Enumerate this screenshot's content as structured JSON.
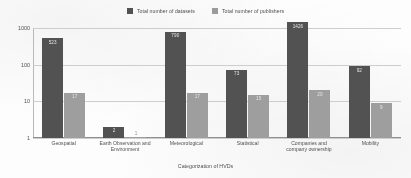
{
  "chart_data": {
    "type": "bar",
    "title": "",
    "xlabel": "Categorization of HVDs",
    "ylabel": "",
    "yscale": "log",
    "ylim": [
      1,
      1000
    ],
    "yticks": [
      "1",
      "10",
      "100",
      "1000"
    ],
    "grid": true,
    "legend_position": "top-center",
    "categories": [
      "Geospatial",
      "Earth Observation and Environment",
      "Meteorological",
      "Statistical",
      "Companies and company ownership",
      "Mobility"
    ],
    "series": [
      {
        "name": "Total number of datasets",
        "color": "#4d4d4d",
        "values": [
          523,
          2,
          790,
          73,
          1426,
          92
        ]
      },
      {
        "name": "Total number of publishers",
        "color": "#9d9d9d",
        "values": [
          17,
          1,
          17,
          15,
          20,
          9
        ]
      }
    ]
  },
  "legend": {
    "items": [
      {
        "label": "Total number of datasets"
      },
      {
        "label": "Total number of publishers"
      }
    ]
  },
  "axes": {
    "x_title": "Categorization of HVDs"
  }
}
